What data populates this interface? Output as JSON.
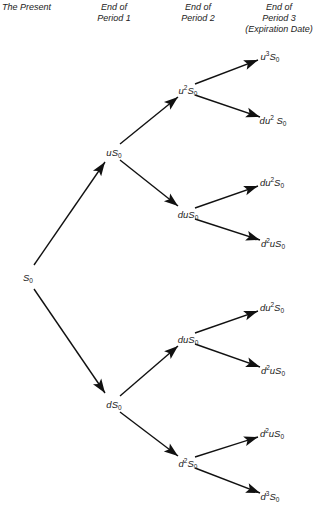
{
  "headers": [
    {
      "lines": [
        "The Present"
      ]
    },
    {
      "lines": [
        "End of",
        "Period 1"
      ]
    },
    {
      "lines": [
        "End of",
        "Period 2"
      ]
    },
    {
      "lines": [
        "End of",
        "Period 3",
        "(Expiration Date)"
      ]
    }
  ],
  "nodes": [
    {
      "id": "n0",
      "pre": "",
      "sup": "",
      "mid": "S",
      "sub": "0",
      "x": 28,
      "y": 277
    },
    {
      "id": "n1u",
      "pre": "u",
      "sup": "",
      "mid": "S",
      "sub": "0",
      "x": 114,
      "y": 152
    },
    {
      "id": "n1d",
      "pre": "d",
      "sup": "",
      "mid": "S",
      "sub": "0",
      "x": 114,
      "y": 404
    },
    {
      "id": "n2a",
      "pre": "u",
      "sup": "2",
      "mid": "S",
      "sub": "0",
      "x": 188,
      "y": 90
    },
    {
      "id": "n2b",
      "pre": "du",
      "sup": "",
      "mid": "S",
      "sub": "0",
      "x": 188,
      "y": 214
    },
    {
      "id": "n2c",
      "pre": "du",
      "sup": "",
      "mid": "S",
      "sub": "0",
      "x": 188,
      "y": 339
    },
    {
      "id": "n2d",
      "pre": "d",
      "sup": "2",
      "mid": "S",
      "sub": "0",
      "x": 188,
      "y": 463
    },
    {
      "id": "n3a",
      "pre": "u",
      "sup": "3",
      "mid": "S",
      "sub": "0",
      "x": 270,
      "y": 56
    },
    {
      "id": "n3b",
      "pre": "du",
      "sup": "2",
      "mid": " S",
      "sub": "0",
      "x": 273,
      "y": 120
    },
    {
      "id": "n3c",
      "pre": "du",
      "sup": "2",
      "mid": "S",
      "sub": "0",
      "x": 272,
      "y": 182
    },
    {
      "id": "n3d",
      "pre": "d",
      "sup": "2",
      "mid": "uS",
      "sub": "0",
      "x": 273,
      "y": 243
    },
    {
      "id": "n3e",
      "pre": "du",
      "sup": "2",
      "mid": "S",
      "sub": "0",
      "x": 272,
      "y": 307
    },
    {
      "id": "n3f",
      "pre": "d",
      "sup": "2",
      "mid": "uS",
      "sub": "0",
      "x": 273,
      "y": 370
    },
    {
      "id": "n3g",
      "pre": "d",
      "sup": "2",
      "mid": "uS",
      "sub": "0",
      "x": 272,
      "y": 433
    },
    {
      "id": "n3h",
      "pre": "d",
      "sup": "3",
      "mid": "S",
      "sub": "0",
      "x": 270,
      "y": 496
    }
  ],
  "edges": [
    [
      34,
      265,
      105,
      162
    ],
    [
      34,
      289,
      105,
      393
    ],
    [
      120,
      144,
      178,
      97
    ],
    [
      120,
      160,
      178,
      206
    ],
    [
      120,
      396,
      178,
      346
    ],
    [
      120,
      412,
      178,
      456
    ],
    [
      195,
      84,
      258,
      60
    ],
    [
      195,
      95,
      260,
      117
    ],
    [
      195,
      208,
      258,
      186
    ],
    [
      195,
      219,
      260,
      240
    ],
    [
      195,
      333,
      258,
      311
    ],
    [
      195,
      344,
      260,
      367
    ],
    [
      195,
      457,
      258,
      437
    ],
    [
      195,
      468,
      260,
      493
    ]
  ],
  "colors": {
    "arrow": "#111111",
    "text": "#222222",
    "background": "#ffffff"
  }
}
